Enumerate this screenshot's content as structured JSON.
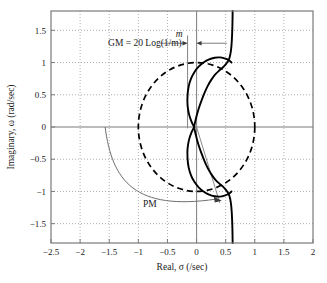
{
  "chart_data": {
    "type": "line",
    "title": "",
    "xlabel": "Real, σ (/sec)",
    "ylabel": "Imaginary, ω (rad/sec)",
    "xlim": [
      -2.5,
      2.0
    ],
    "ylim": [
      -1.8,
      1.8
    ],
    "xticks": [
      -2.5,
      -2,
      -1.5,
      -1,
      -0.5,
      0,
      0.5,
      1,
      1.5,
      2
    ],
    "xtick_labels": [
      "−2.5",
      "−2",
      "−1.5",
      "−1",
      "−0.5",
      "0",
      "0.5",
      "1",
      "1.5",
      "2"
    ],
    "yticks": [
      -1.5,
      -1,
      -0.5,
      0,
      0.5,
      1,
      1.5
    ],
    "ytick_labels": [
      "−1.5",
      "−1",
      "−0.5",
      "0",
      "0.5",
      "1",
      "1.5"
    ],
    "grid": true,
    "grid_style": "dotted",
    "legend": "none",
    "series": [
      {
        "name": "nyquist-contour",
        "style": "solid",
        "color": "#000000",
        "points": [
          [
            0.62,
            1.8
          ],
          [
            0.615,
            1.55
          ],
          [
            0.605,
            1.33
          ],
          [
            0.59,
            1.18
          ],
          [
            0.565,
            1.07
          ],
          [
            0.525,
            1.0
          ],
          [
            0.47,
            0.94
          ],
          [
            0.4,
            0.885
          ],
          [
            0.325,
            0.82
          ],
          [
            0.255,
            0.735
          ],
          [
            0.19,
            0.635
          ],
          [
            0.135,
            0.525
          ],
          [
            0.085,
            0.41
          ],
          [
            0.04,
            0.295
          ],
          [
            0.005,
            0.185
          ],
          [
            -0.02,
            0.095
          ],
          [
            -0.035,
            0.035
          ],
          [
            -0.04,
            0.0
          ],
          [
            -0.035,
            -0.035
          ],
          [
            -0.02,
            -0.095
          ],
          [
            0.005,
            -0.185
          ],
          [
            0.04,
            -0.295
          ],
          [
            0.085,
            -0.41
          ],
          [
            0.135,
            -0.525
          ],
          [
            0.19,
            -0.635
          ],
          [
            0.255,
            -0.735
          ],
          [
            0.325,
            -0.82
          ],
          [
            0.4,
            -0.885
          ],
          [
            0.47,
            -0.94
          ],
          [
            0.525,
            -1.0
          ],
          [
            0.565,
            -1.07
          ],
          [
            0.59,
            -1.18
          ],
          [
            0.605,
            -1.33
          ],
          [
            0.615,
            -1.55
          ],
          [
            0.62,
            -1.8
          ]
        ]
      },
      {
        "name": "nyquist-inner-loop",
        "style": "solid",
        "color": "#000000",
        "points": [
          [
            -0.04,
            0.0
          ],
          [
            -0.085,
            0.08
          ],
          [
            -0.13,
            0.2
          ],
          [
            -0.155,
            0.34
          ],
          [
            -0.155,
            0.49
          ],
          [
            -0.135,
            0.63
          ],
          [
            -0.095,
            0.75
          ],
          [
            -0.035,
            0.855
          ],
          [
            0.04,
            0.94
          ],
          [
            0.125,
            1.005
          ],
          [
            0.215,
            1.05
          ],
          [
            0.31,
            1.075
          ],
          [
            0.4,
            1.08
          ],
          [
            0.48,
            1.065
          ],
          [
            0.55,
            1.04
          ],
          [
            0.6,
            1.0
          ]
        ]
      },
      {
        "name": "nyquist-inner-loop-mirror",
        "style": "solid",
        "color": "#000000",
        "points": [
          [
            -0.04,
            0.0
          ],
          [
            -0.085,
            -0.08
          ],
          [
            -0.13,
            -0.2
          ],
          [
            -0.155,
            -0.34
          ],
          [
            -0.155,
            -0.49
          ],
          [
            -0.135,
            -0.63
          ],
          [
            -0.095,
            -0.75
          ],
          [
            -0.035,
            -0.855
          ],
          [
            0.04,
            -0.94
          ],
          [
            0.125,
            -1.005
          ],
          [
            0.215,
            -1.05
          ],
          [
            0.31,
            -1.075
          ],
          [
            0.4,
            -1.08
          ],
          [
            0.48,
            -1.065
          ],
          [
            0.55,
            -1.04
          ],
          [
            0.6,
            -1.0
          ]
        ]
      },
      {
        "name": "unit-circle",
        "style": "dashed",
        "color": "#000000",
        "center": [
          0,
          0
        ],
        "radius": 1.0
      }
    ],
    "annotations": [
      {
        "name": "gain-margin-label",
        "text": "GM = 20 Log(1/m)",
        "x": -1.52,
        "y": 1.3
      },
      {
        "name": "m-label",
        "text": "m",
        "x": -0.3,
        "y": 1.45,
        "italic": true
      },
      {
        "name": "phase-margin-label",
        "text": "PM",
        "x": -0.92,
        "y": -1.19
      }
    ],
    "markers": [
      {
        "name": "gain-crossing-vertical",
        "x": -0.155,
        "y0": -0.02,
        "y1": 1.42,
        "color": "#8a8a8a"
      },
      {
        "name": "imaginary-axis-vertical",
        "x": 0.0,
        "y0": -1.8,
        "y1": 1.8,
        "color": "#8a8a8a"
      },
      {
        "name": "phase-margin-ray",
        "x0": 0.0,
        "y0": 0.0,
        "x1": 0.4,
        "y1": -1.18,
        "color": "#8a8a8a"
      }
    ]
  },
  "figure": {
    "background": "#ffffff",
    "frame_color": "#7a7a7a",
    "grid_color": "#9a9a9a",
    "axis_color": "#7a7a7a",
    "curve_color": "#000000",
    "annotation_color": "#8a8a8a"
  }
}
